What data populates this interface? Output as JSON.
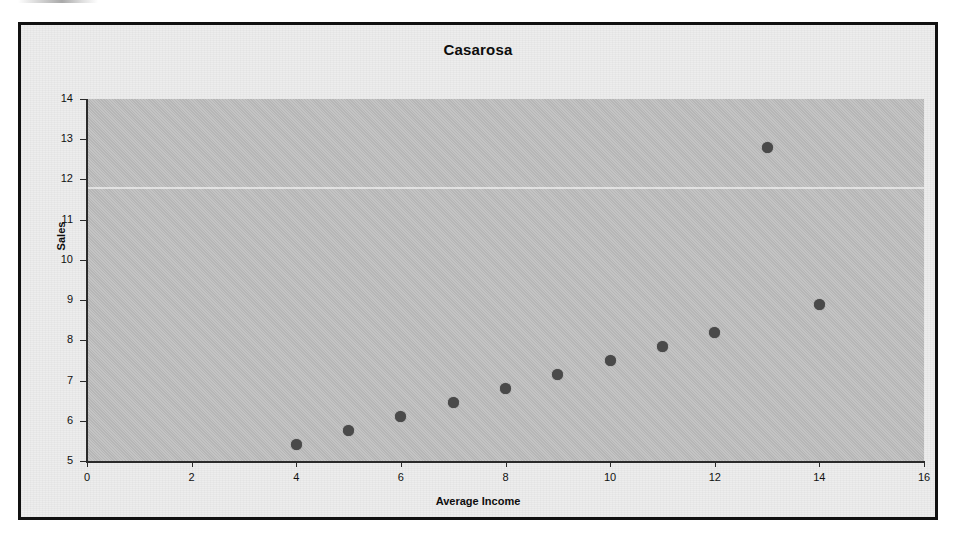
{
  "chart": {
    "title": "Casarosa",
    "frame_color": "#111111",
    "background_color": "#ededed",
    "plot_background_color": "#bdbdbd",
    "marker_color": "#4a4a4a"
  },
  "chart_data": {
    "type": "scatter",
    "title": "Casarosa",
    "xlabel": "Average Income",
    "ylabel": "Sales",
    "xlim": [
      0,
      16
    ],
    "ylim": [
      5,
      14
    ],
    "xticks": [
      0,
      2,
      4,
      6,
      8,
      10,
      12,
      14,
      16
    ],
    "yticks": [
      5,
      6,
      7,
      8,
      9,
      10,
      11,
      12,
      13,
      14
    ],
    "grid": false,
    "legend": false,
    "series": [
      {
        "name": "Casarosa",
        "x": [
          4,
          5,
          6,
          7,
          8,
          9,
          10,
          11,
          12,
          13,
          14
        ],
        "y": [
          5.4,
          5.75,
          6.1,
          6.45,
          6.8,
          7.15,
          7.5,
          7.85,
          8.2,
          12.8,
          8.9
        ]
      }
    ],
    "points": [
      {
        "x": 4,
        "y": 5.4
      },
      {
        "x": 5,
        "y": 5.75
      },
      {
        "x": 6,
        "y": 6.1
      },
      {
        "x": 7,
        "y": 6.45
      },
      {
        "x": 8,
        "y": 6.8
      },
      {
        "x": 9,
        "y": 7.15
      },
      {
        "x": 10,
        "y": 7.5
      },
      {
        "x": 11,
        "y": 7.85
      },
      {
        "x": 12,
        "y": 8.2
      },
      {
        "x": 13,
        "y": 12.8
      },
      {
        "x": 14,
        "y": 8.9
      }
    ],
    "annotations": []
  }
}
